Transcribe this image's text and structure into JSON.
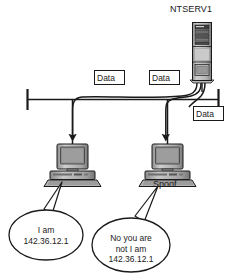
{
  "diagram": {
    "type": "network-diagram",
    "colors": {
      "stroke": "#1a1a1a",
      "background": "#ffffff",
      "device_light": "#d4d4d4",
      "device_mid": "#9a9a9a",
      "device_dark": "#5a5a5a",
      "screen": "#8a8a8a"
    }
  },
  "server": {
    "label": "NTSERV1",
    "icon": "server-tower-icon"
  },
  "bus": {
    "icon": "network-bus-icon",
    "terminator_left": "bus-terminator-icon",
    "terminator_right": "bus-terminator-icon"
  },
  "packets": [
    {
      "label": "Data"
    },
    {
      "label": "Data"
    },
    {
      "label": "Data"
    }
  ],
  "hosts": [
    {
      "id": "victim",
      "icon": "desktop-computer-icon",
      "label": "",
      "bubble": {
        "lines": [
          "I am",
          "142.36.12.1"
        ],
        "line1": "I am",
        "line2": "142.36.12.1",
        "line3": ""
      }
    },
    {
      "id": "attacker",
      "icon": "desktop-computer-icon",
      "label": "Spoof",
      "bubble": {
        "lines": [
          "No you are",
          "not I am",
          "142.36.12.1"
        ],
        "line1": "No you are",
        "line2": "not I am",
        "line3": "142.36.12.1"
      }
    }
  ]
}
